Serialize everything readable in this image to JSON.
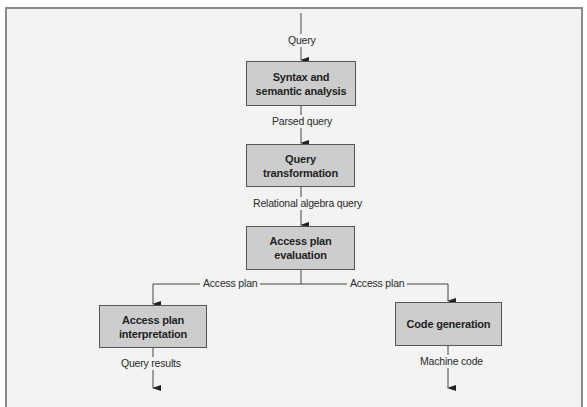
{
  "diagram": {
    "type": "flowchart",
    "title": "",
    "colors": {
      "frame_border": "#8a8a8a",
      "background": "#f3f3f3",
      "box_fill": "#cdcdcd",
      "box_border": "#555555",
      "line": "#333333"
    },
    "input_label": "Query",
    "nodes": [
      {
        "id": "syntax",
        "label": "Syntax and semantic analysis"
      },
      {
        "id": "transform",
        "label": "Query transformation"
      },
      {
        "id": "evaluation",
        "label": "Access plan evaluation"
      },
      {
        "id": "interpretation",
        "label": "Access plan interpretation"
      },
      {
        "id": "codegen",
        "label": "Code generation"
      }
    ],
    "edges": [
      {
        "from": "input",
        "to": "syntax",
        "label": "Query"
      },
      {
        "from": "syntax",
        "to": "transform",
        "label": "Parsed query"
      },
      {
        "from": "transform",
        "to": "evaluation",
        "label": "Relational algebra query"
      },
      {
        "from": "evaluation",
        "to": "interpretation",
        "label": "Access plan"
      },
      {
        "from": "evaluation",
        "to": "codegen",
        "label": "Access plan"
      },
      {
        "from": "interpretation",
        "to": "output",
        "label": "Query results"
      },
      {
        "from": "codegen",
        "to": "output",
        "label": "Machine code"
      }
    ]
  }
}
